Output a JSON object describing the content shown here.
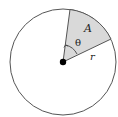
{
  "diagram": {
    "labels": {
      "area": "A",
      "angle": "θ",
      "radius": "r"
    },
    "colors": {
      "sector_fill": "#d9d9d9",
      "stroke": "#555555",
      "center_dot": "#000000"
    },
    "geometry": {
      "center": [
        63,
        62
      ],
      "radius": 53,
      "sector_start_point": [
        70,
        9
      ],
      "sector_end_point": [
        111,
        39
      ]
    }
  }
}
